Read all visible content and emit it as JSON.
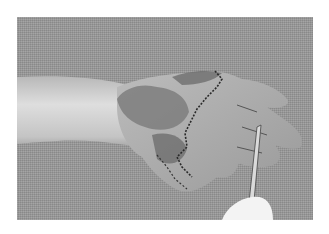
{
  "image": {
    "description": "Grayscale clinical photograph of a forearm and hand lying on a textured gray cloth, showing a sutured skin graft over the dorsum of the hand and wrist, with a surgical instrument (forceps/scissors) held by a gloved hand pointing at the fingers.",
    "style": "grayscale photograph",
    "background": "textured gray fabric",
    "frame": {
      "left": 17,
      "top": 17,
      "width": 296,
      "height": 203
    },
    "colors": {
      "page_background": "#ffffff",
      "fabric": "#9a9a9a",
      "skin": "#c8c8c8",
      "graft": "#7a7a7a",
      "glove": "#f2f2f2",
      "instrument": "#d8d8d8"
    },
    "subjects": [
      "forearm",
      "hand",
      "skin-graft",
      "sutures",
      "surgical-instrument",
      "gloved-hand"
    ]
  }
}
